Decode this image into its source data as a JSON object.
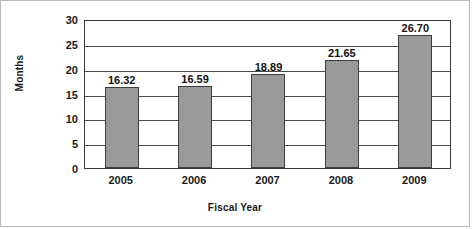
{
  "chart_data": {
    "type": "bar",
    "title": "",
    "xlabel": "Fiscal Year",
    "ylabel": "Months",
    "categories": [
      "2005",
      "2006",
      "2007",
      "2008",
      "2009"
    ],
    "values": [
      16.32,
      16.59,
      18.89,
      21.65,
      26.7
    ],
    "value_labels": [
      "16.32",
      "16.59",
      "18.89",
      "21.65",
      "26.70"
    ],
    "ylim": [
      0,
      30
    ],
    "ytick_step": 5,
    "yticks": [
      "30",
      "25",
      "20",
      "15",
      "10",
      "5",
      "0"
    ],
    "ytick_values": [
      30,
      25,
      20,
      15,
      10,
      5,
      0
    ],
    "grid": "horizontal",
    "legend": "none",
    "series": [
      {
        "name": "Months",
        "values": [
          16.32,
          16.59,
          18.89,
          21.65,
          26.7
        ]
      }
    ],
    "colors": {
      "bar_fill": "#9a9a9a",
      "bar_border": "#3d3d3d",
      "grid": "#4a4a4a",
      "axis": "#3a3a3a",
      "text": "#1a1a1a",
      "background": "#ffffff",
      "frame_border": "#b9b9b9"
    }
  }
}
